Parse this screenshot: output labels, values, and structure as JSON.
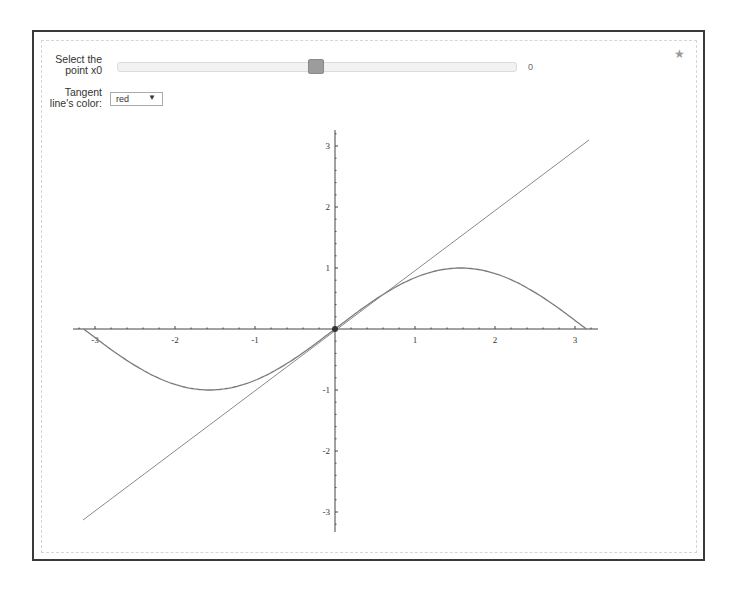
{
  "controls": {
    "slider": {
      "label_line1": "Select the",
      "label_line2": "point x0",
      "value": "0",
      "min": -3.14159,
      "max": 3.14159
    },
    "color_select": {
      "label_line1": "Tangent",
      "label_line2": "line's color:",
      "selected": "red",
      "arrow": "▼"
    },
    "star": "★"
  },
  "plot": {
    "function": "sin(x)",
    "tangent_at": 0,
    "x_ticks": [
      "-3",
      "-2",
      "-1",
      "1",
      "2",
      "3"
    ],
    "y_ticks": [
      "3",
      "2",
      "1",
      "-1",
      "-2",
      "-3"
    ],
    "colors": {
      "curve": "#7a7a7a",
      "tangent": "#8a8a8a",
      "axis": "#444444",
      "point": "#333333"
    }
  }
}
